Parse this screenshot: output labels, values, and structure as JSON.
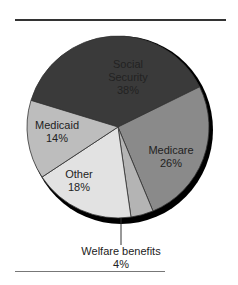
{
  "chart_data": {
    "type": "pie",
    "title": "",
    "slices": [
      {
        "label": "Social Security",
        "value": 38,
        "display": "38%",
        "color": "#3a3a3a"
      },
      {
        "label": "Medicare",
        "value": 26,
        "display": "26%",
        "color": "#8a8a8a"
      },
      {
        "label": "Welfare benefits",
        "value": 4,
        "display": "4%",
        "color": "#b4b4b4"
      },
      {
        "label": "Other",
        "value": 18,
        "display": "18%",
        "color": "#e2e2e2"
      },
      {
        "label": "Medicaid",
        "value": 14,
        "display": "14%",
        "color": "#bdbdbd"
      }
    ],
    "labels": {
      "social_security_line1": "Social",
      "social_security_line2": "Security",
      "social_security_pct": "38%",
      "medicare": "Medicare",
      "medicare_pct": "26%",
      "medicaid": "Medicaid",
      "medicaid_pct": "14%",
      "other": "Other",
      "other_pct": "18%",
      "welfare": "Welfare benefits",
      "welfare_pct": "4%"
    }
  }
}
